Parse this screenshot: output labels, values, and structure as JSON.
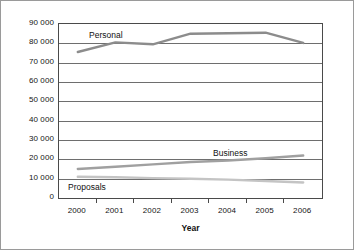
{
  "chart_data": {
    "type": "line",
    "title": "",
    "xlabel": "Year",
    "ylabel": "",
    "categories": [
      "2000",
      "2001",
      "2002",
      "2003",
      "2004",
      "2005",
      "2006"
    ],
    "x": [
      2000,
      2001,
      2002,
      2003,
      2004,
      2005,
      2006
    ],
    "ylim": [
      0,
      90000
    ],
    "ytick_values": [
      0,
      10000,
      20000,
      30000,
      40000,
      50000,
      60000,
      70000,
      80000,
      90000
    ],
    "ytick_labels": [
      "0",
      "10 000",
      "20 000",
      "30 000",
      "40 000",
      "50 000",
      "60 000",
      "70 000",
      "80 000",
      "90 000"
    ],
    "grid": "horizontal",
    "legend": "inline-labels",
    "series": [
      {
        "name": "Personal",
        "color": "#8c8c8c",
        "values": [
          75500,
          80500,
          79500,
          85000,
          85200,
          85500,
          80200
        ]
      },
      {
        "name": "Business",
        "color": "#a0a0a0",
        "values": [
          15000,
          16200,
          17400,
          18600,
          19400,
          20600,
          22000
        ]
      },
      {
        "name": "Proposals",
        "color": "#c4c4c4",
        "values": [
          11000,
          10700,
          10300,
          10000,
          9500,
          8800,
          8000
        ]
      }
    ]
  },
  "axis": {
    "x_title": "Year"
  },
  "labels": {
    "personal": "Personal",
    "business": "Business",
    "proposals": "Proposals"
  }
}
